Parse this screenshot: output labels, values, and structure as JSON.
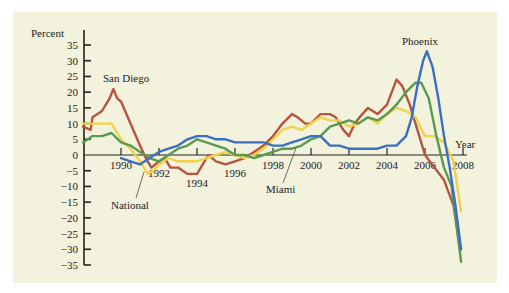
{
  "chart_data": {
    "type": "line",
    "title": "",
    "xlabel": "Year",
    "ylabel": "Percent",
    "ylim": [
      -35,
      35
    ],
    "xlim": [
      1988,
      2008
    ],
    "yticks": [
      35,
      30,
      25,
      20,
      15,
      10,
      5,
      0,
      -5,
      -10,
      -15,
      -20,
      -25,
      -30,
      -35
    ],
    "ytick_labels": [
      "35",
      "30",
      "25",
      "20",
      "15",
      "10",
      "5",
      "0",
      "−5",
      "−10",
      "−15",
      "−20",
      "−25",
      "−30",
      "−35"
    ],
    "xticks": [
      1990,
      1992,
      1994,
      1996,
      1998,
      2000,
      2002,
      2004,
      2006,
      2008
    ],
    "xtick_labels": [
      "1990",
      "1992",
      "1994",
      "1996",
      "1998",
      "2000",
      "2002",
      "2004",
      "2006",
      "2008"
    ],
    "grid": false,
    "legend": "direct labels on lines",
    "annotations": [
      {
        "text": "San Diego",
        "series": "San Diego"
      },
      {
        "text": "Phoenix",
        "series": "Phoenix"
      },
      {
        "text": "National",
        "series": "National"
      },
      {
        "text": "Miami",
        "series": "Miami"
      }
    ],
    "series": [
      {
        "name": "San Diego",
        "color": "#b5543f",
        "x": [
          1988.0,
          1988.4,
          1988.5,
          1989.0,
          1989.4,
          1989.6,
          1989.8,
          1990.0,
          1990.5,
          1991.0,
          1991.3,
          1991.6,
          1992.0,
          1992.3,
          1992.6,
          1993.0,
          1993.5,
          1994.0,
          1994.3,
          1994.6,
          1995.0,
          1995.5,
          1996.0,
          1996.5,
          1997.0,
          1997.5,
          1998.0,
          1998.5,
          1999.0,
          1999.3,
          1999.7,
          2000.0,
          2000.5,
          2001.0,
          2001.3,
          2001.7,
          2002.0,
          2002.3,
          2002.7,
          2003.0,
          2003.5,
          2004.0,
          2004.5,
          2004.8,
          2005.2,
          2005.6,
          2006.0,
          2006.5,
          2007.0,
          2007.5,
          2007.8
        ],
        "values": [
          9,
          8,
          12,
          14,
          18,
          21,
          18,
          17,
          10,
          3,
          -1,
          -4,
          -2,
          -1,
          -4,
          -4,
          -6,
          -6,
          -3,
          0,
          -2,
          -3,
          -2,
          -1,
          1,
          3,
          6,
          10,
          13,
          12,
          10,
          10,
          13,
          13,
          12,
          8,
          6,
          10,
          13,
          15,
          13,
          16,
          24,
          22,
          16,
          8,
          0,
          -4,
          -8,
          -16,
          -28
        ]
      },
      {
        "name": "National",
        "color": "#f0d24a",
        "x": [
          1988.0,
          1988.5,
          1989.0,
          1989.5,
          1990.0,
          1990.5,
          1991.0,
          1991.4,
          1991.7,
          1992.0,
          1992.5,
          1993.0,
          1993.5,
          1994.0,
          1994.5,
          1995.0,
          1995.5,
          1996.0,
          1996.5,
          1997.0,
          1997.5,
          1998.0,
          1998.5,
          1999.0,
          1999.5,
          2000.0,
          2000.5,
          2001.0,
          2001.5,
          2002.0,
          2002.5,
          2003.0,
          2003.5,
          2004.0,
          2004.5,
          2005.0,
          2005.5,
          2006.0,
          2006.5,
          2007.0,
          2007.5,
          2007.9
        ],
        "values": [
          10,
          10,
          10,
          10,
          5,
          2,
          -2,
          -6,
          -5,
          -3,
          -1,
          -2,
          -2,
          -2,
          -1,
          0,
          1,
          0,
          -1,
          0,
          2,
          5,
          8,
          9,
          8,
          10,
          12,
          11,
          11,
          9,
          10,
          12,
          10,
          13,
          15,
          14,
          12,
          6,
          6,
          4,
          -2,
          -18
        ]
      },
      {
        "name": "Miami",
        "color": "#5a9a50",
        "x": [
          1988.0,
          1988.5,
          1989.0,
          1989.5,
          1990.0,
          1990.5,
          1991.0,
          1991.5,
          1992.0,
          1992.5,
          1993.0,
          1993.5,
          1994.0,
          1994.5,
          1995.0,
          1995.5,
          1996.0,
          1996.5,
          1997.0,
          1997.5,
          1998.0,
          1998.5,
          1999.0,
          1999.5,
          2000.0,
          2000.5,
          2001.0,
          2001.5,
          2002.0,
          2002.5,
          2003.0,
          2003.5,
          2004.0,
          2004.5,
          2005.0,
          2005.5,
          2005.8,
          2006.2,
          2006.6,
          2007.0,
          2007.4,
          2007.9
        ],
        "values": [
          4,
          6,
          6,
          7,
          4,
          3,
          1,
          -1,
          -2,
          0,
          2,
          3,
          5,
          4,
          3,
          2,
          0,
          0,
          -1,
          0,
          1,
          2,
          2,
          3,
          5,
          6,
          9,
          10,
          11,
          10,
          12,
          11,
          13,
          16,
          20,
          23,
          23,
          18,
          6,
          -4,
          -10,
          -34
        ]
      },
      {
        "name": "Phoenix",
        "color": "#3b6fc4",
        "x": [
          1990.0,
          1990.5,
          1991.0,
          1991.5,
          1992.0,
          1992.5,
          1993.0,
          1993.5,
          1994.0,
          1994.5,
          1995.0,
          1995.5,
          1996.0,
          1996.5,
          1997.0,
          1997.5,
          1998.0,
          1998.5,
          1999.0,
          1999.5,
          2000.0,
          2000.5,
          2001.0,
          2001.5,
          2002.0,
          2002.5,
          2003.0,
          2003.5,
          2004.0,
          2004.5,
          2005.0,
          2005.3,
          2005.6,
          2005.9,
          2006.1,
          2006.4,
          2006.7,
          2007.0,
          2007.3,
          2007.6,
          2007.9
        ],
        "values": [
          -1,
          -2,
          -3,
          -1,
          1,
          2,
          3,
          5,
          6,
          6,
          5,
          5,
          4,
          4,
          4,
          4,
          3,
          3,
          4,
          5,
          6,
          6,
          3,
          3,
          2,
          2,
          2,
          2,
          3,
          3,
          6,
          12,
          22,
          30,
          33,
          28,
          18,
          6,
          -4,
          -16,
          -30
        ]
      }
    ]
  }
}
